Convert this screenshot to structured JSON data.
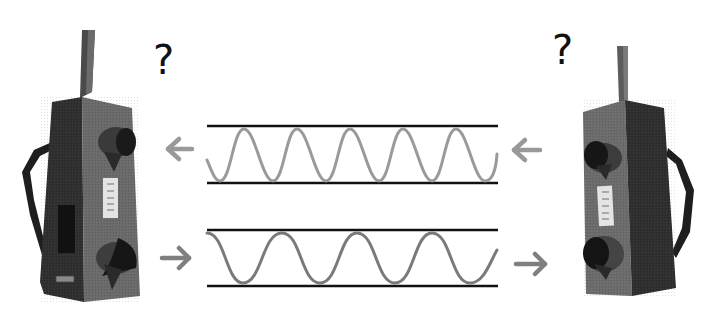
{
  "scene": {
    "description": "Two walkie-talkies exchanging wave signals in opposite directions",
    "background": "#ffffff"
  },
  "labels": {
    "left_question": "?",
    "right_question": "?"
  },
  "devices": [
    {
      "name": "left-walkie-talkie",
      "facing": "right",
      "strap": "left side"
    },
    {
      "name": "right-walkie-talkie",
      "facing": "left",
      "strap": "right side"
    }
  ],
  "channels": [
    {
      "name": "top-channel",
      "direction": "right-to-left",
      "wave": "higher frequency",
      "cycles": 5.5,
      "wave_color": "#9a9a9a"
    },
    {
      "name": "bottom-channel",
      "direction": "left-to-right",
      "wave": "lower frequency",
      "cycles": 4,
      "wave_color": "#7a7a7a"
    }
  ],
  "colors": {
    "line": "#111111",
    "arrow": "#8c8c8c",
    "device_dark": "#2e2e2e",
    "device_light": "#6a6a6a"
  }
}
